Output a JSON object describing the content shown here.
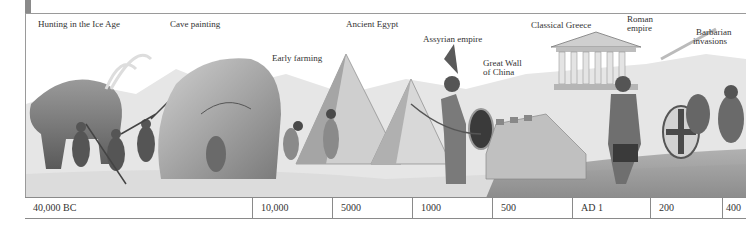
{
  "timeline": {
    "events": [
      {
        "label": "Hunting in the Ice Age",
        "x": 38,
        "y": 19
      },
      {
        "label": "Cave painting",
        "x": 170,
        "y": 19
      },
      {
        "label": "Early farming",
        "x": 272,
        "y": 53
      },
      {
        "label": "Ancient Egypt",
        "x": 346,
        "y": 19
      },
      {
        "label": "Assyrian empire",
        "x": 423,
        "y": 34
      },
      {
        "label": "Great Wall",
        "x": 483,
        "y": 58
      },
      {
        "label": "of China",
        "x": 483,
        "y": 67
      },
      {
        "label": "Classical Greece",
        "x": 531,
        "y": 20
      },
      {
        "label": "Roman",
        "x": 627,
        "y": 14
      },
      {
        "label": "empire",
        "x": 627,
        "y": 23
      },
      {
        "label": "Barbarian",
        "x": 696,
        "y": 27
      },
      {
        "label": "invasions",
        "x": 693,
        "y": 36
      }
    ],
    "dates": [
      {
        "label": "40,000 BC",
        "width": 227
      },
      {
        "label": "10,000",
        "width": 80
      },
      {
        "label": "5000",
        "width": 80
      },
      {
        "label": "1000",
        "width": 80
      },
      {
        "label": "500",
        "width": 80
      },
      {
        "label": "AD 1",
        "width": 78
      },
      {
        "label": "200",
        "width": 72
      },
      {
        "label": "400",
        "width": 24
      }
    ]
  },
  "colors": {
    "ink": "#333333",
    "rule": "#8a8a8a",
    "shade": "#7a7a7a"
  }
}
